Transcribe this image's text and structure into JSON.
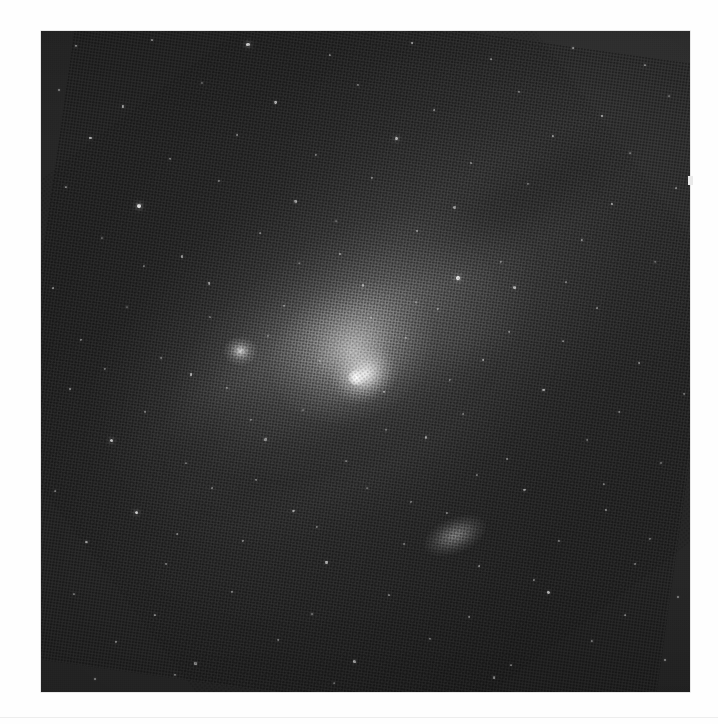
{
  "page": {
    "background_color": "#fefefe",
    "rule_color": "#ededed",
    "caption": ""
  },
  "plate": {
    "title": "Andromeda Galaxy (M31) photographic plate",
    "subject": "M31 spiral galaxy with companions",
    "medium": "halftone-printed monochrome astrophotograph",
    "x": 41,
    "y": 31,
    "width": 649,
    "height": 661,
    "background_color": "#272727",
    "highlight_color": "#ffffff",
    "border_color": "#d8d8d8"
  },
  "objects": [
    {
      "name": "M31 nucleus",
      "label": "galaxy-core",
      "cx_pct": 48.6,
      "cy_pct": 52.4,
      "brightness": 1.0
    },
    {
      "name": "M31 central bulge",
      "label": "galaxy-bulge",
      "cx_pct": 48.0,
      "cy_pct": 48.5,
      "brightness": 0.56
    },
    {
      "name": "M31 disk",
      "label": "galaxy-disk",
      "cx_pct": 48.0,
      "cy_pct": 47.0,
      "brightness": 0.2,
      "position_angle_deg": -29
    },
    {
      "name": "M31 outer halo",
      "label": "galaxy-halo",
      "cx_pct": 50.0,
      "cy_pct": 47.0,
      "brightness": 0.09,
      "position_angle_deg": -29
    },
    {
      "name": "M32 companion",
      "label": "companion-galaxy-m32",
      "cx_pct": 30.7,
      "cy_pct": 48.4,
      "brightness": 0.8
    },
    {
      "name": "M110 companion",
      "label": "companion-galaxy-m110",
      "cx_pct": 63.7,
      "cy_pct": 76.3,
      "brightness": 0.42,
      "position_angle_deg": -22
    },
    {
      "name": "dust lane inner",
      "label": "dust-lane-1",
      "cx_pct": 43.0,
      "cy_pct": 54.0,
      "brightness": -0.3
    },
    {
      "name": "dust lane outer",
      "label": "dust-lane-2",
      "cx_pct": 47.0,
      "cy_pct": 61.0,
      "brightness": -0.26
    },
    {
      "name": "dust lane north",
      "label": "dust-lane-3",
      "cx_pct": 74.0,
      "cy_pct": 25.5,
      "brightness": -0.2
    }
  ],
  "artifacts": {
    "right_edge_speck": {
      "x": 688,
      "y": 176,
      "w": 5,
      "h": 9,
      "color": "#e9e9e9"
    }
  },
  "chart_data": {
    "type": "scatter",
    "xlabel": "",
    "ylabel": "",
    "xlim": [
      0,
      100
    ],
    "ylim": [
      0,
      100
    ],
    "grid": false,
    "legend": "none",
    "note": "Star positions are percentages of the plate box; r is dot radius in px, b is relative brightness 0-1.",
    "stars": [
      {
        "x": 5.4,
        "y": 2.3,
        "r": 1.1,
        "b": 0.55
      },
      {
        "x": 17.1,
        "y": 1.3,
        "r": 1.0,
        "b": 0.5
      },
      {
        "x": 31.9,
        "y": 2.0,
        "r": 1.6,
        "b": 0.8
      },
      {
        "x": 44.5,
        "y": 3.6,
        "r": 1.0,
        "b": 0.45
      },
      {
        "x": 57.2,
        "y": 1.8,
        "r": 1.2,
        "b": 0.6
      },
      {
        "x": 69.4,
        "y": 4.3,
        "r": 1.0,
        "b": 0.45
      },
      {
        "x": 82.0,
        "y": 2.6,
        "r": 1.3,
        "b": 0.62
      },
      {
        "x": 93.1,
        "y": 5.1,
        "r": 1.1,
        "b": 0.52
      },
      {
        "x": 2.7,
        "y": 8.9,
        "r": 1.0,
        "b": 0.45
      },
      {
        "x": 12.6,
        "y": 11.4,
        "r": 1.2,
        "b": 0.58
      },
      {
        "x": 24.8,
        "y": 7.8,
        "r": 1.0,
        "b": 0.44
      },
      {
        "x": 36.1,
        "y": 10.8,
        "r": 1.4,
        "b": 0.7
      },
      {
        "x": 48.8,
        "y": 8.1,
        "r": 1.0,
        "b": 0.46
      },
      {
        "x": 60.5,
        "y": 12.0,
        "r": 1.1,
        "b": 0.52
      },
      {
        "x": 73.6,
        "y": 9.3,
        "r": 1.0,
        "b": 0.44
      },
      {
        "x": 86.4,
        "y": 12.9,
        "r": 1.2,
        "b": 0.58
      },
      {
        "x": 96.8,
        "y": 9.8,
        "r": 1.0,
        "b": 0.46
      },
      {
        "x": 7.6,
        "y": 16.2,
        "r": 1.3,
        "b": 0.64
      },
      {
        "x": 19.9,
        "y": 19.4,
        "r": 1.0,
        "b": 0.44
      },
      {
        "x": 30.2,
        "y": 15.7,
        "r": 1.1,
        "b": 0.52
      },
      {
        "x": 42.4,
        "y": 18.8,
        "r": 1.0,
        "b": 0.45
      },
      {
        "x": 54.7,
        "y": 16.3,
        "r": 1.5,
        "b": 0.76
      },
      {
        "x": 66.3,
        "y": 19.9,
        "r": 1.0,
        "b": 0.44
      },
      {
        "x": 78.9,
        "y": 15.9,
        "r": 1.2,
        "b": 0.58
      },
      {
        "x": 90.7,
        "y": 18.5,
        "r": 1.0,
        "b": 0.46
      },
      {
        "x": 3.9,
        "y": 23.6,
        "r": 1.1,
        "b": 0.52
      },
      {
        "x": 15.1,
        "y": 26.5,
        "r": 1.8,
        "b": 0.88
      },
      {
        "x": 27.5,
        "y": 22.7,
        "r": 1.0,
        "b": 0.44
      },
      {
        "x": 39.2,
        "y": 25.8,
        "r": 1.2,
        "b": 0.58
      },
      {
        "x": 51.0,
        "y": 22.2,
        "r": 1.0,
        "b": 0.45
      },
      {
        "x": 63.7,
        "y": 26.7,
        "r": 1.1,
        "b": 0.52
      },
      {
        "x": 75.1,
        "y": 23.1,
        "r": 1.0,
        "b": 0.44
      },
      {
        "x": 88.0,
        "y": 26.2,
        "r": 1.3,
        "b": 0.64
      },
      {
        "x": 97.9,
        "y": 23.8,
        "r": 1.0,
        "b": 0.46
      },
      {
        "x": 9.4,
        "y": 31.3,
        "r": 1.0,
        "b": 0.45
      },
      {
        "x": 21.7,
        "y": 34.1,
        "r": 1.2,
        "b": 0.58
      },
      {
        "x": 33.8,
        "y": 30.5,
        "r": 1.0,
        "b": 0.44
      },
      {
        "x": 46.1,
        "y": 33.7,
        "r": 1.1,
        "b": 0.52
      },
      {
        "x": 58.0,
        "y": 30.2,
        "r": 1.0,
        "b": 0.45
      },
      {
        "x": 64.2,
        "y": 37.4,
        "r": 1.9,
        "b": 0.92
      },
      {
        "x": 70.9,
        "y": 34.9,
        "r": 1.0,
        "b": 0.44
      },
      {
        "x": 83.4,
        "y": 31.6,
        "r": 1.2,
        "b": 0.58
      },
      {
        "x": 94.6,
        "y": 35.0,
        "r": 1.0,
        "b": 0.46
      },
      {
        "x": 1.8,
        "y": 38.9,
        "r": 1.1,
        "b": 0.52
      },
      {
        "x": 13.3,
        "y": 41.8,
        "r": 1.0,
        "b": 0.44
      },
      {
        "x": 25.9,
        "y": 38.2,
        "r": 1.2,
        "b": 0.58
      },
      {
        "x": 37.4,
        "y": 41.6,
        "r": 1.0,
        "b": 0.45
      },
      {
        "x": 49.6,
        "y": 38.5,
        "r": 1.1,
        "b": 0.52
      },
      {
        "x": 61.2,
        "y": 42.1,
        "r": 1.0,
        "b": 0.44
      },
      {
        "x": 73.0,
        "y": 38.8,
        "r": 1.3,
        "b": 0.64
      },
      {
        "x": 85.7,
        "y": 41.9,
        "r": 1.0,
        "b": 0.46
      },
      {
        "x": 6.2,
        "y": 46.7,
        "r": 1.0,
        "b": 0.45
      },
      {
        "x": 18.5,
        "y": 49.5,
        "r": 1.1,
        "b": 0.52
      },
      {
        "x": 23.1,
        "y": 52.0,
        "r": 1.4,
        "b": 0.7
      },
      {
        "x": 35.0,
        "y": 46.1,
        "r": 1.0,
        "b": 0.44
      },
      {
        "x": 43.0,
        "y": 49.9,
        "r": 1.0,
        "b": 0.42
      },
      {
        "x": 56.3,
        "y": 46.4,
        "r": 1.0,
        "b": 0.45
      },
      {
        "x": 68.1,
        "y": 49.8,
        "r": 1.2,
        "b": 0.58
      },
      {
        "x": 80.4,
        "y": 46.9,
        "r": 1.0,
        "b": 0.44
      },
      {
        "x": 92.2,
        "y": 50.2,
        "r": 1.1,
        "b": 0.52
      },
      {
        "x": 4.5,
        "y": 54.2,
        "r": 1.2,
        "b": 0.58
      },
      {
        "x": 16.0,
        "y": 57.6,
        "r": 1.0,
        "b": 0.44
      },
      {
        "x": 28.7,
        "y": 54.0,
        "r": 1.0,
        "b": 0.45
      },
      {
        "x": 40.3,
        "y": 57.4,
        "r": 1.0,
        "b": 0.42
      },
      {
        "x": 52.8,
        "y": 54.6,
        "r": 1.1,
        "b": 0.52
      },
      {
        "x": 65.0,
        "y": 57.9,
        "r": 1.0,
        "b": 0.44
      },
      {
        "x": 77.4,
        "y": 54.3,
        "r": 1.3,
        "b": 0.64
      },
      {
        "x": 89.1,
        "y": 57.7,
        "r": 1.0,
        "b": 0.46
      },
      {
        "x": 99.0,
        "y": 54.9,
        "r": 1.0,
        "b": 0.44
      },
      {
        "x": 10.8,
        "y": 62.0,
        "r": 1.5,
        "b": 0.76
      },
      {
        "x": 22.3,
        "y": 65.3,
        "r": 1.0,
        "b": 0.44
      },
      {
        "x": 34.6,
        "y": 61.8,
        "r": 1.1,
        "b": 0.52
      },
      {
        "x": 47.0,
        "y": 65.0,
        "r": 1.0,
        "b": 0.45
      },
      {
        "x": 59.3,
        "y": 61.5,
        "r": 1.2,
        "b": 0.58
      },
      {
        "x": 71.8,
        "y": 64.8,
        "r": 1.0,
        "b": 0.44
      },
      {
        "x": 84.2,
        "y": 61.9,
        "r": 1.0,
        "b": 0.46
      },
      {
        "x": 95.5,
        "y": 65.4,
        "r": 1.1,
        "b": 0.52
      },
      {
        "x": 2.1,
        "y": 69.6,
        "r": 1.0,
        "b": 0.45
      },
      {
        "x": 14.7,
        "y": 72.8,
        "r": 1.6,
        "b": 0.8
      },
      {
        "x": 26.4,
        "y": 69.2,
        "r": 1.0,
        "b": 0.44
      },
      {
        "x": 38.9,
        "y": 72.6,
        "r": 1.2,
        "b": 0.58
      },
      {
        "x": 50.2,
        "y": 69.1,
        "r": 1.0,
        "b": 0.45
      },
      {
        "x": 62.6,
        "y": 72.9,
        "r": 1.0,
        "b": 0.44
      },
      {
        "x": 74.5,
        "y": 69.4,
        "r": 1.1,
        "b": 0.52
      },
      {
        "x": 87.1,
        "y": 72.4,
        "r": 1.0,
        "b": 0.46
      },
      {
        "x": 7.0,
        "y": 77.3,
        "r": 1.2,
        "b": 0.58
      },
      {
        "x": 19.3,
        "y": 80.7,
        "r": 1.0,
        "b": 0.44
      },
      {
        "x": 31.1,
        "y": 77.1,
        "r": 1.0,
        "b": 0.45
      },
      {
        "x": 44.0,
        "y": 80.4,
        "r": 1.3,
        "b": 0.64
      },
      {
        "x": 55.9,
        "y": 77.6,
        "r": 1.0,
        "b": 0.44
      },
      {
        "x": 67.5,
        "y": 80.9,
        "r": 1.1,
        "b": 0.52
      },
      {
        "x": 79.8,
        "y": 77.2,
        "r": 1.0,
        "b": 0.46
      },
      {
        "x": 91.6,
        "y": 80.6,
        "r": 1.0,
        "b": 0.44
      },
      {
        "x": 5.1,
        "y": 85.1,
        "r": 1.0,
        "b": 0.45
      },
      {
        "x": 17.6,
        "y": 88.4,
        "r": 1.1,
        "b": 0.52
      },
      {
        "x": 29.4,
        "y": 84.8,
        "r": 1.0,
        "b": 0.44
      },
      {
        "x": 41.8,
        "y": 88.2,
        "r": 1.2,
        "b": 0.58
      },
      {
        "x": 53.6,
        "y": 85.3,
        "r": 1.0,
        "b": 0.45
      },
      {
        "x": 66.0,
        "y": 88.7,
        "r": 1.0,
        "b": 0.44
      },
      {
        "x": 78.2,
        "y": 85.0,
        "r": 1.4,
        "b": 0.7
      },
      {
        "x": 90.0,
        "y": 88.3,
        "r": 1.0,
        "b": 0.46
      },
      {
        "x": 98.2,
        "y": 85.6,
        "r": 1.0,
        "b": 0.44
      },
      {
        "x": 11.5,
        "y": 92.5,
        "r": 1.0,
        "b": 0.45
      },
      {
        "x": 23.8,
        "y": 95.7,
        "r": 1.1,
        "b": 0.52
      },
      {
        "x": 36.5,
        "y": 92.1,
        "r": 1.0,
        "b": 0.44
      },
      {
        "x": 48.3,
        "y": 95.4,
        "r": 1.2,
        "b": 0.58
      },
      {
        "x": 60.0,
        "y": 92.0,
        "r": 1.0,
        "b": 0.45
      },
      {
        "x": 72.4,
        "y": 95.9,
        "r": 1.0,
        "b": 0.44
      },
      {
        "x": 84.9,
        "y": 92.3,
        "r": 1.1,
        "b": 0.52
      },
      {
        "x": 96.2,
        "y": 95.1,
        "r": 1.0,
        "b": 0.46
      },
      {
        "x": 8.3,
        "y": 98.1,
        "r": 1.0,
        "b": 0.44
      },
      {
        "x": 20.6,
        "y": 97.4,
        "r": 1.0,
        "b": 0.45
      },
      {
        "x": 45.2,
        "y": 98.6,
        "r": 1.0,
        "b": 0.42
      },
      {
        "x": 69.8,
        "y": 97.8,
        "r": 1.1,
        "b": 0.52
      },
      {
        "x": 26.0,
        "y": 43.2,
        "r": 1.0,
        "b": 0.4
      },
      {
        "x": 32.4,
        "y": 58.9,
        "r": 1.0,
        "b": 0.4
      },
      {
        "x": 57.8,
        "y": 41.0,
        "r": 1.0,
        "b": 0.4
      },
      {
        "x": 53.1,
        "y": 60.3,
        "r": 1.0,
        "b": 0.4
      },
      {
        "x": 67.2,
        "y": 67.1,
        "r": 1.0,
        "b": 0.42
      },
      {
        "x": 39.7,
        "y": 35.1,
        "r": 1.0,
        "b": 0.4
      },
      {
        "x": 45.5,
        "y": 28.7,
        "r": 1.0,
        "b": 0.4
      },
      {
        "x": 72.1,
        "y": 45.6,
        "r": 1.0,
        "b": 0.42
      },
      {
        "x": 80.9,
        "y": 37.9,
        "r": 1.0,
        "b": 0.42
      },
      {
        "x": 15.9,
        "y": 35.6,
        "r": 1.0,
        "b": 0.42
      },
      {
        "x": 9.9,
        "y": 51.2,
        "r": 1.0,
        "b": 0.42
      },
      {
        "x": 63.0,
        "y": 52.8,
        "r": 1.0,
        "b": 0.42
      },
      {
        "x": 50.8,
        "y": 43.4,
        "r": 1.0,
        "b": 0.38
      },
      {
        "x": 57.0,
        "y": 71.2,
        "r": 1.0,
        "b": 0.42
      },
      {
        "x": 33.2,
        "y": 68.0,
        "r": 1.0,
        "b": 0.42
      },
      {
        "x": 86.8,
        "y": 68.5,
        "r": 1.0,
        "b": 0.44
      },
      {
        "x": 21.0,
        "y": 76.1,
        "r": 1.0,
        "b": 0.44
      },
      {
        "x": 75.9,
        "y": 83.0,
        "r": 1.0,
        "b": 0.44
      },
      {
        "x": 42.6,
        "y": 75.0,
        "r": 1.0,
        "b": 0.42
      },
      {
        "x": 93.8,
        "y": 76.8,
        "r": 1.0,
        "b": 0.44
      }
    ]
  }
}
